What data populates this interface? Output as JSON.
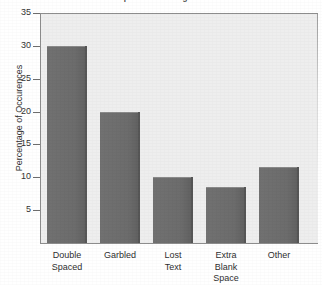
{
  "chart_data": {
    "type": "bar",
    "title": "Problems Experienced Using Electronic Mail",
    "xlabel": "",
    "ylabel": "Percentage of Occurences",
    "categories": [
      "Double Spaced",
      "Garbled",
      "Lost Text",
      "Extra Blank Space",
      "Other"
    ],
    "category_lines": [
      [
        "Double",
        "Spaced"
      ],
      [
        "Garbled"
      ],
      [
        "Lost",
        "Text"
      ],
      [
        "Extra",
        "Blank",
        "Space"
      ],
      [
        "Other"
      ]
    ],
    "values": [
      30,
      20,
      10,
      8.5,
      11.5
    ],
    "ylim": [
      0,
      35
    ],
    "yticks": [
      5,
      10,
      15,
      20,
      25,
      30,
      35
    ],
    "ytick_labels": [
      "5",
      "10",
      "15",
      "20",
      "25",
      "30",
      "35"
    ],
    "grid": false,
    "legend": null,
    "colors": {
      "bar_fill": "#6e6e6e",
      "bar_edge": "#565656",
      "plot_background": "#eeeeee",
      "axis_line": "#8d8d8d",
      "text": "#2f2f2f",
      "page_background": "#ffffff"
    }
  }
}
